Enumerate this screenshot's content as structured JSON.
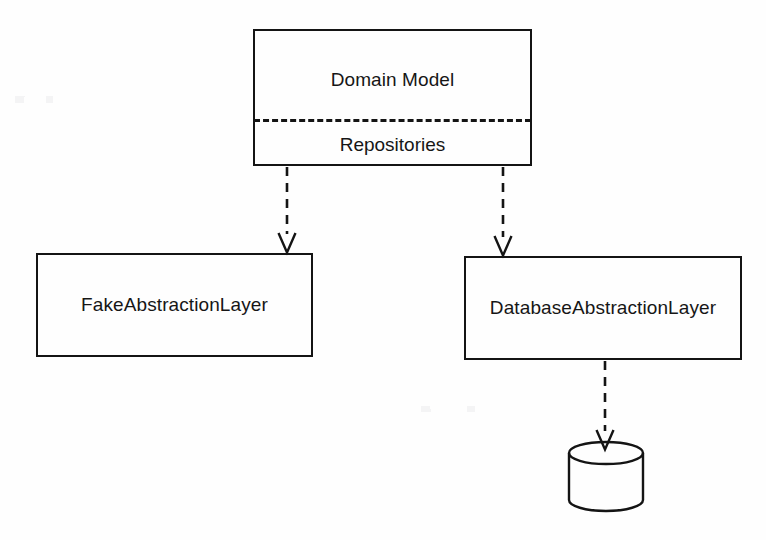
{
  "diagram": {
    "type": "uml-component-diagram",
    "stroke_color": "#141414",
    "background_color": "#fefefe",
    "nodes": [
      {
        "id": "domain-model",
        "label": "Domain Model",
        "compartment_label": "Repositories",
        "shape": "rectangle-two-compartments",
        "x": 253,
        "y": 29,
        "width": 279,
        "height": 137,
        "separator_style": "dashed"
      },
      {
        "id": "fake-abstraction-layer",
        "label": "FakeAbstractionLayer",
        "shape": "rectangle",
        "x": 36,
        "y": 253,
        "width": 277,
        "height": 104
      },
      {
        "id": "database-abstraction-layer",
        "label": "DatabaseAbstractionLayer",
        "shape": "rectangle",
        "x": 464,
        "y": 256,
        "width": 278,
        "height": 104
      },
      {
        "id": "database-store",
        "label": "",
        "shape": "cylinder",
        "x": 568,
        "y": 446,
        "width": 76,
        "height": 66
      }
    ],
    "edges": [
      {
        "id": "repositories-to-fake-layer",
        "from": "domain-model",
        "to": "fake-abstraction-layer",
        "style": "dashed",
        "arrowhead": "open",
        "label": ""
      },
      {
        "id": "repositories-to-database-layer",
        "from": "domain-model",
        "to": "database-abstraction-layer",
        "style": "dashed",
        "arrowhead": "open",
        "label": ""
      },
      {
        "id": "database-layer-to-store",
        "from": "database-abstraction-layer",
        "to": "database-store",
        "style": "dashed",
        "arrowhead": "open",
        "label": ""
      }
    ]
  }
}
